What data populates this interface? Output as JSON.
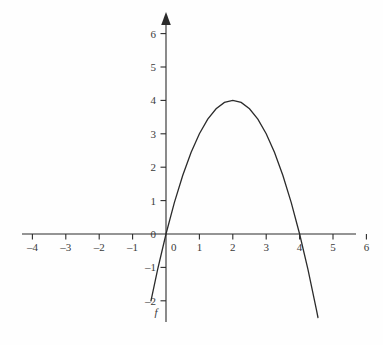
{
  "chart_data": {
    "type": "line",
    "title": "",
    "subtitle": "",
    "xlabel": "",
    "ylabel": "",
    "xlim": [
      -4,
      6
    ],
    "ylim": [
      -2,
      6
    ],
    "grid": false,
    "legend_position": "none",
    "series": [
      {
        "name": "f",
        "label": "f",
        "expression": "f(x) = -x^2 + 4x",
        "vertex": [
          2,
          4
        ],
        "roots": [
          0,
          4
        ],
        "x_domain_drawn": [
          -0.45,
          4.55
        ],
        "points": [
          [
            -0.45,
            -2.0
          ],
          [
            -0.25,
            -1.06
          ],
          [
            0.0,
            0.0
          ],
          [
            0.25,
            0.94
          ],
          [
            0.5,
            1.75
          ],
          [
            0.75,
            2.44
          ],
          [
            1.0,
            3.0
          ],
          [
            1.25,
            3.44
          ],
          [
            1.5,
            3.75
          ],
          [
            1.75,
            3.94
          ],
          [
            2.0,
            4.0
          ],
          [
            2.25,
            3.94
          ],
          [
            2.5,
            3.75
          ],
          [
            2.75,
            3.44
          ],
          [
            3.0,
            3.0
          ],
          [
            3.25,
            2.44
          ],
          [
            3.5,
            1.75
          ],
          [
            3.75,
            0.94
          ],
          [
            4.0,
            0.0
          ],
          [
            4.25,
            -1.06
          ],
          [
            4.5,
            -2.25
          ],
          [
            4.55,
            -2.5
          ]
        ]
      }
    ],
    "x_ticks": [
      {
        "value": -4,
        "label": "–4"
      },
      {
        "value": -3,
        "label": "–3"
      },
      {
        "value": -2,
        "label": "–2"
      },
      {
        "value": -1,
        "label": "–1"
      },
      {
        "value": 0,
        "label": "0"
      },
      {
        "value": 1,
        "label": "1"
      },
      {
        "value": 2,
        "label": "2"
      },
      {
        "value": 3,
        "label": "3"
      },
      {
        "value": 4,
        "label": "4"
      },
      {
        "value": 5,
        "label": "5"
      },
      {
        "value": 6,
        "label": "6"
      }
    ],
    "y_ticks": [
      {
        "value": 6,
        "label": "6"
      },
      {
        "value": 5,
        "label": "5"
      },
      {
        "value": 4,
        "label": "4"
      },
      {
        "value": 3,
        "label": "3"
      },
      {
        "value": 2,
        "label": "2"
      },
      {
        "value": 1,
        "label": "1"
      },
      {
        "value": 0,
        "label": "0"
      },
      {
        "value": -1,
        "label": "–1"
      },
      {
        "value": -2,
        "label": "–2"
      }
    ],
    "colors": {
      "curve": "#2b2b2b",
      "axis": "#2b2b2b",
      "text": "#3a3a3a",
      "background": "#fefefe"
    },
    "annotations": [
      {
        "name": "curve-name",
        "text": "f",
        "x": -0.3,
        "y": -2.45
      }
    ],
    "axis_style": {
      "x_axis_arrow": false,
      "y_axis_arrow": true,
      "x_tick_side": "below",
      "y_tick_side": "left"
    }
  }
}
